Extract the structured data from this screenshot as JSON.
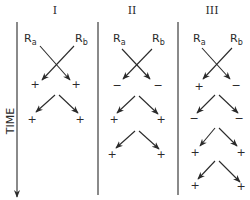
{
  "time_axis": {
    "label": "TIME",
    "x": 17,
    "y1": 22,
    "y2": 197,
    "label_x": 11,
    "label_y": 121
  },
  "dividers": [
    {
      "x": 98,
      "y1": 22,
      "y2": 195
    },
    {
      "x": 178,
      "y1": 22,
      "y2": 195
    }
  ],
  "columns": [
    {
      "header": "I",
      "header_x": 55,
      "ra": {
        "label": "R",
        "sub": "a",
        "x": 24,
        "y": 42
      },
      "rb": {
        "label": "R",
        "sub": "b",
        "x": 75,
        "y": 42
      },
      "cross": {
        "from_left": [
          40,
          46
        ],
        "to_left": [
          70,
          80
        ],
        "from_right": [
          74,
          46
        ],
        "to_right": [
          42,
          80
        ]
      },
      "first_signs": [
        "+",
        "+"
      ],
      "first_sign_pos": [
        [
          35,
          88
        ],
        [
          76,
          88
        ]
      ],
      "chevrons": [
        {
          "apex": [
            57,
            95
          ],
          "left": [
            36,
            112
          ],
          "right": [
            78,
            113
          ],
          "signs": [
            "+",
            "+"
          ],
          "sign_pos": [
            [
              32,
              123
            ],
            [
              80,
              123
            ]
          ]
        }
      ]
    },
    {
      "header": "II",
      "header_x": 132,
      "ra": {
        "label": "R",
        "sub": "a",
        "x": 113,
        "y": 42
      },
      "rb": {
        "label": "R",
        "sub": "b",
        "x": 152,
        "y": 42
      },
      "cross": {
        "from_left": [
          122,
          49
        ],
        "to_left": [
          150,
          79
        ],
        "from_right": [
          152,
          49
        ],
        "to_right": [
          123,
          79
        ]
      },
      "first_signs": [
        "−",
        "−"
      ],
      "first_sign_pos": [
        [
          117,
          89
        ],
        [
          158,
          89
        ]
      ],
      "chevrons": [
        {
          "apex": [
            137,
            96
          ],
          "left": [
            117,
            113
          ],
          "right": [
            158,
            114
          ],
          "signs": [
            "+",
            "+"
          ],
          "sign_pos": [
            [
              114,
              123
            ],
            [
              161,
              123
            ]
          ]
        },
        {
          "apex": [
            137,
            131
          ],
          "left": [
            116,
            148
          ],
          "right": [
            159,
            149
          ],
          "signs": [
            "+",
            "+"
          ],
          "sign_pos": [
            [
              112,
              158
            ],
            [
              161,
              158
            ]
          ]
        }
      ]
    },
    {
      "header": "III",
      "header_x": 212,
      "ra": {
        "label": "R",
        "sub": "a",
        "x": 193,
        "y": 42
      },
      "rb": {
        "label": "R",
        "sub": "b",
        "x": 230,
        "y": 42
      },
      "cross": {
        "from_left": [
          202,
          48
        ],
        "to_left": [
          230,
          79
        ],
        "from_right": [
          232,
          48
        ],
        "to_right": [
          203,
          79
        ]
      },
      "first_signs": [
        "+",
        "−"
      ],
      "first_sign_pos": [
        [
          199,
          90
        ],
        [
          236,
          89
        ]
      ],
      "chevrons": [
        {
          "apex": [
            217,
            95
          ],
          "left": [
            197,
            113
          ],
          "right": [
            238,
            113
          ],
          "signs": [
            "−",
            "−"
          ],
          "sign_pos": [
            [
              194,
              122
            ],
            [
              239,
              122
            ]
          ]
        },
        {
          "apex": [
            217,
            128
          ],
          "left": [
            200,
            146
          ],
          "right": [
            237,
            146
          ],
          "signs": [
            "+",
            "+"
          ],
          "sign_pos": [
            [
              195,
              156
            ],
            [
              241,
              156
            ]
          ]
        },
        {
          "apex": [
            217,
            161
          ],
          "left": [
            198,
            179
          ],
          "right": [
            240,
            182
          ],
          "signs": [
            "+",
            "+"
          ],
          "sign_pos": [
            [
              195,
              189
            ],
            [
              241,
              190
            ]
          ]
        }
      ]
    }
  ]
}
